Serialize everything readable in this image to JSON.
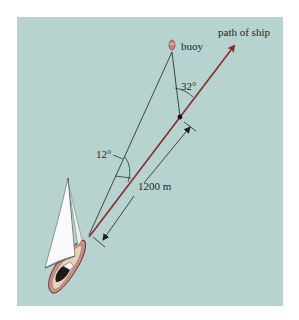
{
  "diagram": {
    "labels": {
      "path": "path of ship",
      "buoy": "buoy",
      "angle_top": "32°",
      "angle_bottom": "12°",
      "distance": "1200 m"
    },
    "colors": {
      "background": "#b7d3d0",
      "ship_path": "#8b2a2a",
      "lines": "#1f1f1f",
      "buoy": "#c97a7a"
    }
  }
}
